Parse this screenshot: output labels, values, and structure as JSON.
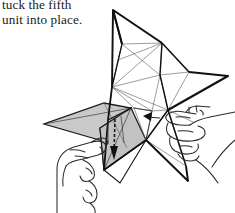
{
  "page": {
    "width": 235,
    "height": 213,
    "background": "#ffffff",
    "kind": "origami-instruction-illustration"
  },
  "caption": {
    "full_text": "tuck the fifth\nunit into place.",
    "lines": [
      "tuck the fifth",
      "unit into place."
    ],
    "note": "first line is clipped at the top edge of the image",
    "color": "#1a1a1a"
  },
  "illustration": {
    "title": "modular origami star assembly",
    "description": "A partially assembled five-pointed modular origami star held between two hands; a shaded flap on the left is being tucked into place, indicated by arrows.",
    "line_color": "#111111",
    "mesh_line_color": "#555555",
    "shade_color": "#c8c8c8",
    "shade_stroke": "#222222",
    "hand_line_color": "#2b2b2b",
    "arrow_color": "#111111",
    "parts": [
      {
        "name": "star-body",
        "label": "folded modular star"
      },
      {
        "name": "shaded-flap",
        "label": "fifth unit flap (shaded)"
      },
      {
        "name": "left-hand",
        "label": "left hand holding flap"
      },
      {
        "name": "right-hand",
        "label": "right hand supporting star"
      },
      {
        "name": "tuck-arrow-down",
        "label": "downward tuck arrow"
      },
      {
        "name": "tuck-arrow-left",
        "label": "small left-pointing arrow"
      }
    ]
  }
}
